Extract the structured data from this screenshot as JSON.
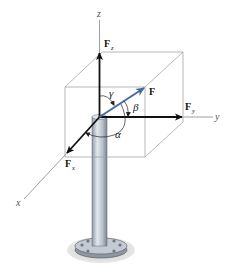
{
  "figure": {
    "axes": {
      "x": "x",
      "y": "y",
      "z": "z"
    },
    "force": {
      "label": "F",
      "color": "#4a6b9a"
    },
    "components": {
      "fx": {
        "main": "F",
        "sub": "x"
      },
      "fy": {
        "main": "F",
        "sub": "y"
      },
      "fz": {
        "main": "F",
        "sub": "z"
      }
    },
    "angles": {
      "alpha": "α",
      "beta": "β",
      "gamma": "γ"
    },
    "colors": {
      "component_arrows": "#111111",
      "force_arrow": "#4a6b9a",
      "box_lines": "#999999",
      "axis_lines": "#777777",
      "post_fill": "#b9c1cb",
      "base_shadow": "#d4d4d4"
    }
  }
}
